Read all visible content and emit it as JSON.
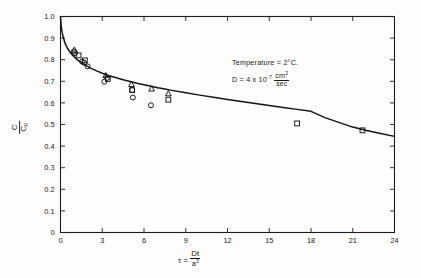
{
  "chart_data": {
    "type": "scatter",
    "title": "",
    "subtitle": "",
    "xlabel": "τ = Dt/a²",
    "ylabel": "C/C₀",
    "xlim": [
      0,
      24
    ],
    "ylim": [
      0,
      1.0
    ],
    "grid": false,
    "legend": "none",
    "x_ticks": [
      0,
      3,
      6,
      9,
      12,
      15,
      18,
      21,
      24
    ],
    "x_tick_labels": [
      "0",
      "3",
      "6",
      "9",
      "12",
      "15",
      "18",
      "21",
      "24"
    ],
    "y_ticks": [
      0,
      0.1,
      0.2,
      0.3,
      0.4,
      0.5,
      0.6,
      0.7,
      0.8,
      0.9,
      1.0
    ],
    "y_tick_labels": [
      "0",
      "0.1",
      "0.2",
      "0.3",
      "0.4",
      "0.5",
      "0.6",
      "0.7",
      "0.8",
      "0.9",
      "1.0"
    ],
    "annotations": [
      "Temperature = 2°C.",
      "D = 4 x 10⁻⁷ cm²/sec"
    ],
    "series": [
      {
        "name": "fitted curve",
        "marker": "none",
        "type": "line",
        "points": [
          [
            0.0,
            1.0
          ],
          [
            0.05,
            0.955
          ],
          [
            0.12,
            0.925
          ],
          [
            0.22,
            0.898
          ],
          [
            0.35,
            0.873
          ],
          [
            0.5,
            0.853
          ],
          [
            0.7,
            0.833
          ],
          [
            0.9,
            0.818
          ],
          [
            1.2,
            0.8
          ],
          [
            1.5,
            0.786
          ],
          [
            1.8,
            0.774
          ],
          [
            2.2,
            0.76
          ],
          [
            2.6,
            0.748
          ],
          [
            3.0,
            0.737
          ],
          [
            3.5,
            0.726
          ],
          [
            4.0,
            0.716
          ],
          [
            4.5,
            0.707
          ],
          [
            5.0,
            0.699
          ],
          [
            5.5,
            0.691
          ],
          [
            6.0,
            0.684
          ],
          [
            6.5,
            0.677
          ],
          [
            7.0,
            0.67
          ],
          [
            7.5,
            0.664
          ],
          [
            8.0,
            0.658
          ],
          [
            9.0,
            0.647
          ],
          [
            10.0,
            0.636
          ],
          [
            11.0,
            0.626
          ],
          [
            12.0,
            0.616
          ],
          [
            13.0,
            0.607
          ],
          [
            14.0,
            0.597
          ],
          [
            15.0,
            0.588
          ],
          [
            16.0,
            0.579
          ],
          [
            17.0,
            0.57
          ],
          [
            18.0,
            0.561
          ],
          [
            19.0,
            0.532
          ],
          [
            20.0,
            0.51
          ],
          [
            21.0,
            0.488
          ],
          [
            22.0,
            0.472
          ],
          [
            23.0,
            0.458
          ],
          [
            24.0,
            0.445
          ]
        ]
      },
      {
        "name": "circle data",
        "marker": "circle",
        "type": "scatter",
        "points": [
          [
            0.95,
            0.838
          ],
          [
            1.05,
            0.83
          ],
          [
            1.55,
            0.791
          ],
          [
            1.7,
            0.786
          ],
          [
            1.95,
            0.769
          ],
          [
            3.15,
            0.698
          ],
          [
            3.35,
            0.716
          ],
          [
            5.15,
            0.66
          ],
          [
            5.2,
            0.625
          ],
          [
            6.5,
            0.589
          ]
        ]
      },
      {
        "name": "square data",
        "marker": "square",
        "type": "scatter",
        "points": [
          [
            1.3,
            0.82
          ],
          [
            1.75,
            0.797
          ],
          [
            3.4,
            0.711
          ],
          [
            5.15,
            0.659
          ],
          [
            7.75,
            0.615
          ],
          [
            17.0,
            0.505
          ],
          [
            21.7,
            0.473
          ]
        ]
      },
      {
        "name": "triangle data",
        "marker": "triangle",
        "type": "scatter",
        "points": [
          [
            1.0,
            0.845
          ],
          [
            3.25,
            0.727
          ],
          [
            5.1,
            0.686
          ],
          [
            6.55,
            0.665
          ],
          [
            7.75,
            0.643
          ]
        ]
      }
    ]
  },
  "annotation_block": {
    "line1_label": "Temperature",
    "line1_eq": "=",
    "line1_value": "2",
    "line1_unit": "°C.",
    "line2_label": "D",
    "line2_eq": "=",
    "line2_coeff": "4 x 10",
    "line2_exp": "-7",
    "line2_num": "cm",
    "line2_num_exp": "2",
    "line2_den": "sec"
  },
  "axis_titles": {
    "y_numerator": "C",
    "y_denominator": "C",
    "y_denominator_sub": "0",
    "x_symbol": "τ",
    "x_eq": "=",
    "x_numerator": "Dt",
    "x_denominator": "a",
    "x_denominator_exp": "2"
  }
}
